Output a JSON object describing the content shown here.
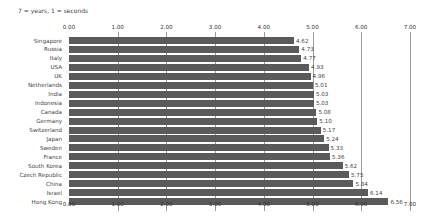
{
  "note": "7 = years, 1 = seconds",
  "chart_data": {
    "type": "bar",
    "orientation": "horizontal",
    "title": "",
    "subtitle": "7 = years, 1 = seconds",
    "xlabel": "",
    "ylabel": "",
    "xlim": [
      0,
      7
    ],
    "grid": true,
    "legend": null,
    "tick_labels": [
      "0.00",
      "1.00",
      "2.00",
      "3.00",
      "4.00",
      "5.00",
      "6.00",
      "7.00"
    ],
    "categories": [
      "Singapore",
      "Russia",
      "Italy",
      "USA",
      "UK",
      "Netherlands",
      "India",
      "Indonesia",
      "Canada",
      "Germany",
      "Switzerland",
      "Japan",
      "Sweden",
      "France",
      "South Korea",
      "Czech Republic",
      "China",
      "Israel",
      "Hong Kong"
    ],
    "values": [
      4.62,
      4.73,
      4.77,
      4.93,
      4.96,
      5.01,
      5.03,
      5.03,
      5.08,
      5.1,
      5.17,
      5.24,
      5.33,
      5.36,
      5.62,
      5.75,
      5.84,
      6.14,
      6.56
    ],
    "value_labels": [
      "4.62",
      "4.73",
      "4.77",
      "4.93",
      "4.96",
      "5.01",
      "5.03",
      "5.03",
      "5.08",
      "5.10",
      "5.17",
      "5.24",
      "5.33",
      "5.36",
      "5.62",
      "5.75",
      "5.84",
      "6.14",
      "6.56"
    ],
    "bar_color": "#5a5a5a"
  }
}
